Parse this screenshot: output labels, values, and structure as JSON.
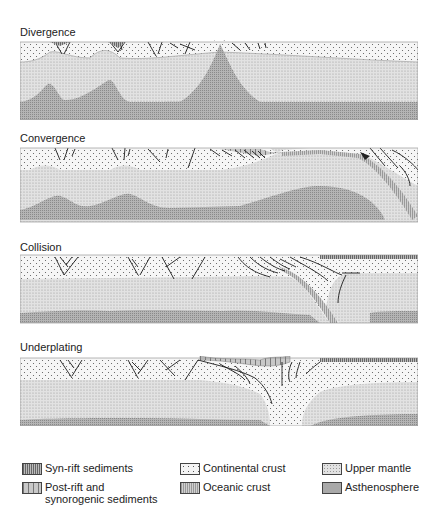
{
  "diagram": {
    "panels": [
      {
        "id": "divergence",
        "label": "Divergence"
      },
      {
        "id": "convergence",
        "label": "Convergence"
      },
      {
        "id": "collision",
        "label": "Collision"
      },
      {
        "id": "underplating",
        "label": "Underplating"
      }
    ],
    "legend": [
      {
        "id": "syn-rift",
        "label": "Syn-rift sediments",
        "pattern": "vertical-hatch-dense"
      },
      {
        "id": "post-rift",
        "label": "Post-rift and\nsynorogenic sediments",
        "pattern": "vertical-hatch-wide"
      },
      {
        "id": "continental-crust",
        "label": "Continental crust",
        "pattern": "sparse-dots"
      },
      {
        "id": "oceanic-crust",
        "label": "Oceanic crust",
        "pattern": "dense-grid"
      },
      {
        "id": "upper-mantle",
        "label": "Upper mantle",
        "pattern": "light-stipple"
      },
      {
        "id": "asthenosphere",
        "label": "Asthenosphere",
        "pattern": "dark-stipple"
      }
    ],
    "colors": {
      "continental": "#f4f4f4",
      "mantle": "#dcdcdc",
      "asthenosphere": "#a9a9a9",
      "oceanic": "#c4c4c4",
      "sediment": "#b8b8b8",
      "line": "#1a1a1a"
    }
  }
}
